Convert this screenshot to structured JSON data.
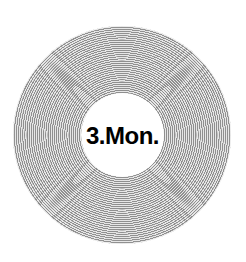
{
  "disc": {
    "label": "3.Mon.",
    "ring_color": "#8f8f8f",
    "gap_color": "#e6e6e6",
    "center_color": "#ffffff",
    "text_color": "#000000"
  }
}
